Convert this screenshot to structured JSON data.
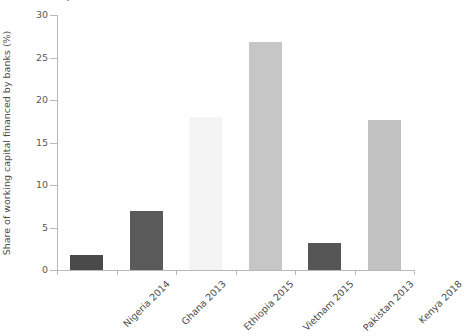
{
  "title_fragment": "ṛ",
  "chart_data": {
    "type": "bar",
    "title": "",
    "xlabel": "",
    "ylabel": "Share of working capital financed by banks (%)",
    "ylim": [
      0,
      30
    ],
    "yticks": [
      0,
      5,
      10,
      15,
      20,
      25,
      30
    ],
    "ytick_labels": [
      "0",
      "5",
      "10",
      "15",
      "20",
      "25",
      "30"
    ],
    "grid": false,
    "legend": null,
    "categories": [
      "Nigeria 2014",
      "Ghana 2013",
      "Ethiopia 2015",
      "Vietnam 2015",
      "Pakistan 2013",
      "Kenya 2018"
    ],
    "values": [
      1.8,
      7.0,
      18.0,
      26.8,
      3.2,
      17.7
    ],
    "bar_colors": [
      "#4a4a4a",
      "#5a5a5a",
      "#f4f4f4",
      "#c6c6c6",
      "#565656",
      "#c2c2c2"
    ]
  },
  "axis_colors": {
    "axis_line": "#b8b8b8",
    "tick_text": "#5a5a5a",
    "label_text": "#4c4c4c"
  }
}
